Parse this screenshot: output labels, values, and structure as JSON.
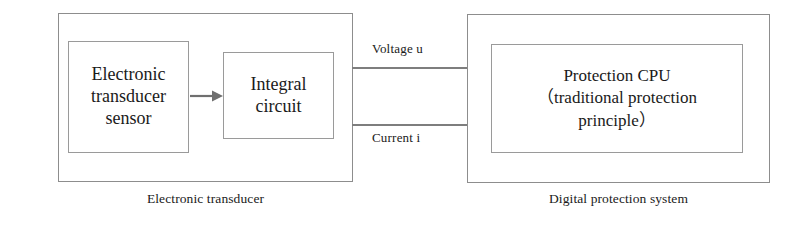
{
  "diagram": {
    "groups": {
      "left": {
        "caption": "Electronic transducer",
        "blocks": [
          {
            "id": "sensor",
            "label": "Electronic\ntransducer\nsensor"
          },
          {
            "id": "integral",
            "label": "Integral\ncircuit"
          }
        ],
        "connector": {
          "name": "arrow-right",
          "from": "sensor",
          "to": "integral"
        }
      },
      "right": {
        "caption": "Digital protection system",
        "blocks": [
          {
            "id": "cpu",
            "label": "Protection CPU\n（traditional  protection\nprinciple）"
          }
        ]
      }
    },
    "signals": [
      {
        "id": "voltage",
        "label": "Voltage u"
      },
      {
        "id": "current",
        "label": "Current i"
      }
    ],
    "colors": {
      "box_border": "#8d8d8d",
      "inner_border": "#9a9a9a",
      "line": "#7e7e7e",
      "text": "#1a1a1a",
      "background": "#ffffff"
    }
  }
}
